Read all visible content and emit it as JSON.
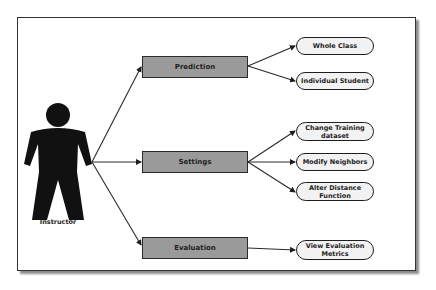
{
  "diagram": {
    "actor": {
      "label": "Instructor",
      "icon": "person-icon"
    },
    "categories": [
      {
        "id": "prediction",
        "label": "Prediction"
      },
      {
        "id": "settings",
        "label": "Settings"
      },
      {
        "id": "evaluation",
        "label": "Evaluation"
      }
    ],
    "use_cases": {
      "prediction": [
        {
          "label": "Whole Class"
        },
        {
          "label": "Individual Student"
        }
      ],
      "settings": [
        {
          "label": "Change Training\ndataset"
        },
        {
          "label": "Modify Neighbors"
        },
        {
          "label": "Alter Distance\nFunction"
        }
      ],
      "evaluation": [
        {
          "label": "View Evaluation\nMetrics"
        }
      ]
    },
    "colors": {
      "category_fill": "#9a9a9a",
      "node_fill": "#f2f2f2",
      "stroke": "#1e1e1e",
      "background": "#ffffff"
    }
  }
}
